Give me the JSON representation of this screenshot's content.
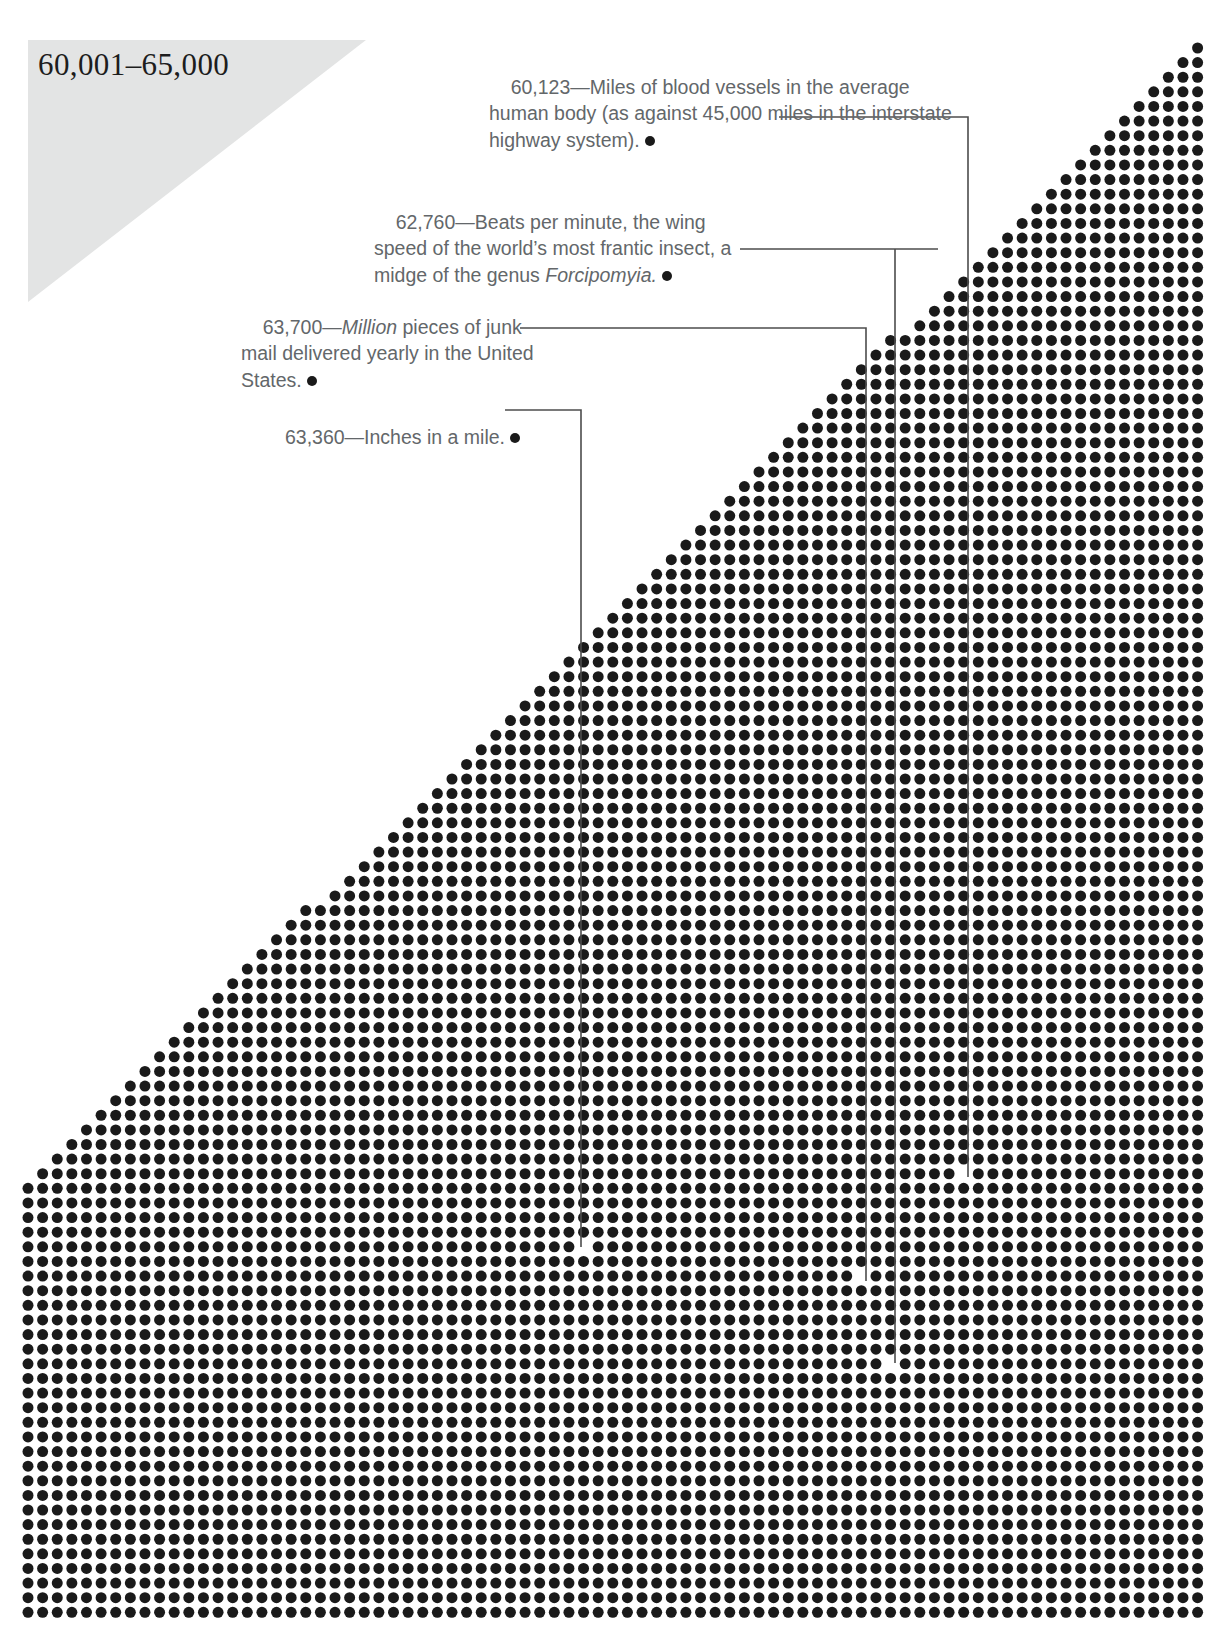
{
  "header": {
    "range_label": "60,001–65,000",
    "banner_color": "#e3e4e4"
  },
  "theme": {
    "dot_color": "#1a1a1a",
    "text_color": "#63676a",
    "leader_color": "#4d4d4d",
    "background": "#ffffff"
  },
  "annotations": [
    {
      "id": "blood-vessels",
      "number": "60,123",
      "dash": "—",
      "text_before": "Miles of blood vessels in the average human body (as against 45,000 miles in the interstate highway system).",
      "italic": "",
      "text_after": "",
      "full_text": "60,123—Miles of blood vessels in the average human body (as against 45,000 miles in the interstate highway system)."
    },
    {
      "id": "midge-wingbeats",
      "number": "62,760",
      "dash": "—",
      "text_before": "Beats per minute, the wing speed of the world’s most frantic insect, a midge of the genus ",
      "italic": "Forcipomyia.",
      "text_after": "",
      "full_text": "62,760—Beats per minute, the wing speed of the world’s most frantic insect, a midge of the genus Forcipomyia."
    },
    {
      "id": "junk-mail",
      "number": "63,700",
      "dash": "—",
      "text_before": "",
      "italic": "Million",
      "text_after": " pieces of junk mail delivered yearly in the United States.",
      "full_text": "63,700—Million pieces of junk mail delivered yearly in the United States."
    },
    {
      "id": "inches-in-a-mile",
      "number": "63,360",
      "dash": "—",
      "text_before": "Inches in a mile.",
      "italic": "",
      "text_after": "",
      "full_text": "63,360—Inches in a mile."
    }
  ],
  "chart_data": {
    "type": "scatter",
    "title": "60,001–65,000",
    "xlabel": "",
    "ylabel": "",
    "grid": false,
    "legend_position": "none",
    "dot_spacing_px": 14.62,
    "dot_diameter_px": 11,
    "grid_columns": 81,
    "grid_rows": 108,
    "field_origin_px": [
      28,
      48
    ],
    "callouts": [
      {
        "label": "60,123",
        "dot_px": [
          968,
          1177
        ],
        "corner_px": [
          968,
          117
        ],
        "text_anchor_px": [
          779,
          117
        ]
      },
      {
        "label": "62,760",
        "dot_px": [
          895,
          1363
        ],
        "corner_px": [
          938,
          249
        ],
        "text_anchor_px": [
          740,
          249
        ]
      },
      {
        "label": "63,700",
        "dot_px": [
          866,
          1281
        ],
        "corner_px": [
          866,
          328
        ],
        "text_anchor_px": [
          520,
          328
        ]
      },
      {
        "label": "63,360",
        "dot_px": [
          581,
          1247
        ],
        "corner_px": [
          581,
          410
        ],
        "text_anchor_px": [
          505,
          410
        ]
      }
    ]
  }
}
